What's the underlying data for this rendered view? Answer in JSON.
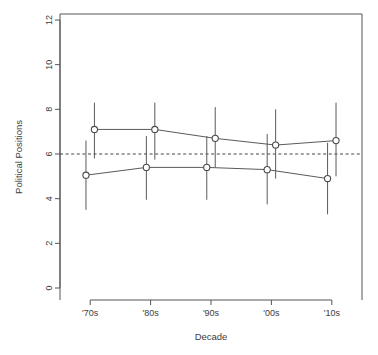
{
  "chart_data": {
    "type": "line",
    "title": "",
    "subtitle": "",
    "xlabel": "Decade",
    "ylabel": "Political Positions",
    "categories": [
      "'70s",
      "'80s",
      "'90s",
      "'00s",
      "'10s"
    ],
    "x": [
      1,
      2,
      3,
      4,
      5
    ],
    "xlim": [
      0.5,
      5.5
    ],
    "ylim": [
      0,
      12
    ],
    "yticks": [
      0,
      2,
      4,
      6,
      8,
      10,
      12
    ],
    "ytick_labels": [
      "0",
      "2",
      "4",
      "6",
      "8",
      "10",
      "12"
    ],
    "xticks": [
      1,
      2,
      3,
      4,
      5
    ],
    "xtick_labels": [
      "'70s",
      "'80s",
      "'90s",
      "'00s",
      "'10s"
    ],
    "grid": false,
    "legend": null,
    "legend_position": "none",
    "reference_lines": [
      {
        "orientation": "horizontal",
        "value": 6.0,
        "style": "dashed",
        "color": "#444444",
        "label": "midpoint"
      }
    ],
    "series": [
      {
        "name": "Upper group",
        "marker": "open-circle",
        "color": "#5a5a5a",
        "values": [
          7.1,
          7.1,
          6.7,
          6.4,
          6.6
        ],
        "err_low": [
          5.8,
          5.75,
          5.4,
          4.9,
          5.0
        ],
        "err_high": [
          8.3,
          8.3,
          8.1,
          8.0,
          8.3
        ],
        "x_offset": 0.07
      },
      {
        "name": "Lower group",
        "marker": "open-circle",
        "color": "#5a5a5a",
        "values": [
          5.05,
          5.4,
          5.4,
          5.3,
          4.9
        ],
        "err_low": [
          3.5,
          3.95,
          3.95,
          3.75,
          3.3
        ],
        "err_high": [
          6.6,
          6.8,
          6.8,
          6.9,
          6.5
        ],
        "x_offset": -0.07
      }
    ],
    "colors": {
      "axis": "#555555",
      "text": "#3c3c3c",
      "line": "#5a5a5a",
      "marker_fill": "#ffffff",
      "marker_stroke": "#4a4a4a",
      "reference": "#444444",
      "background": "#ffffff"
    }
  }
}
